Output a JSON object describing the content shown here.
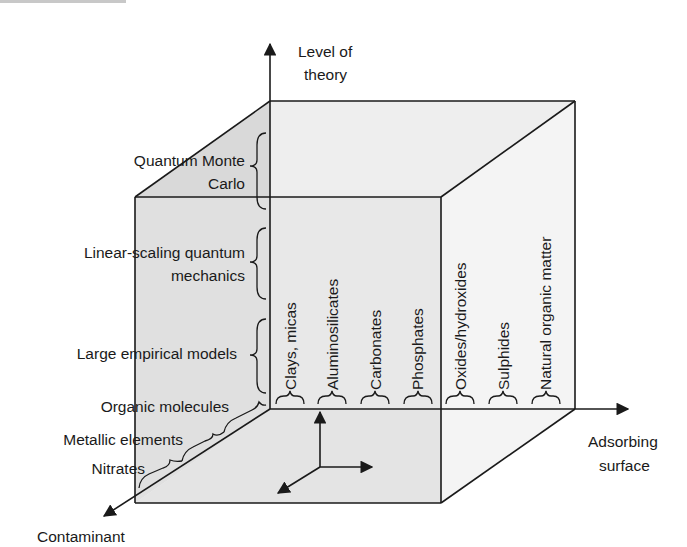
{
  "axes": {
    "vertical": {
      "label_lines": [
        "Level of",
        "theory"
      ]
    },
    "horizontal": {
      "label_lines": [
        "Adsorbing",
        "surface"
      ]
    },
    "depth": {
      "label_lines": [
        "Contaminant"
      ]
    }
  },
  "level_of_theory": [
    {
      "lines": [
        "Quantum Monte",
        "Carlo"
      ]
    },
    {
      "lines": [
        "Linear-scaling quantum",
        "mechanics"
      ]
    },
    {
      "lines": [
        "Large empirical models"
      ]
    }
  ],
  "contaminants": [
    {
      "label": "Organic molecules"
    },
    {
      "label": "Metallic elements"
    },
    {
      "label": "Nitrates"
    }
  ],
  "adsorbing_surfaces": [
    {
      "label": "Clays, micas"
    },
    {
      "label": "Aluminosilicates"
    },
    {
      "label": "Carbonates"
    },
    {
      "label": "Phosphates"
    },
    {
      "label": "Oxides/hydroxides"
    },
    {
      "label": "Sulphides"
    },
    {
      "label": "Natural organic matter"
    }
  ],
  "colors": {
    "line": "#1a1a1a",
    "left_face": "#d9d9d9",
    "back_face": "#ececec",
    "floor": "#e2e2e2",
    "right_region": "#f4f4f4"
  }
}
